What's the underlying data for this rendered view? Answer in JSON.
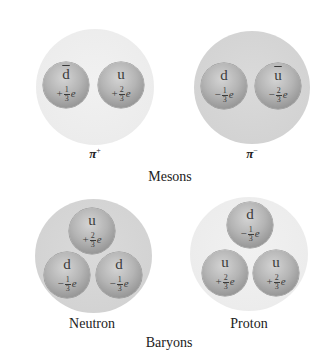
{
  "mesons": {
    "group_label": "Mesons",
    "particles": [
      {
        "name": "π",
        "superscript": "+",
        "quarks": [
          {
            "name": "d",
            "anti": true,
            "sign": "+",
            "num": "1",
            "den": "3",
            "unit": "e"
          },
          {
            "name": "u",
            "anti": false,
            "sign": "+",
            "num": "2",
            "den": "3",
            "unit": "e"
          }
        ]
      },
      {
        "name": "π",
        "superscript": "−",
        "quarks": [
          {
            "name": "d",
            "anti": false,
            "sign": "−",
            "num": "1",
            "den": "3",
            "unit": "e"
          },
          {
            "name": "u",
            "anti": true,
            "sign": "−",
            "num": "2",
            "den": "3",
            "unit": "e"
          }
        ]
      }
    ]
  },
  "baryons": {
    "group_label": "Baryons",
    "particles": [
      {
        "name": "Neutron",
        "quarks": [
          {
            "name": "u",
            "anti": false,
            "sign": "+",
            "num": "2",
            "den": "3",
            "unit": "e"
          },
          {
            "name": "d",
            "anti": false,
            "sign": "−",
            "num": "1",
            "den": "3",
            "unit": "e"
          },
          {
            "name": "d",
            "anti": false,
            "sign": "−",
            "num": "1",
            "den": "3",
            "unit": "e"
          }
        ]
      },
      {
        "name": "Proton",
        "quarks": [
          {
            "name": "d",
            "anti": false,
            "sign": "−",
            "num": "1",
            "den": "3",
            "unit": "e"
          },
          {
            "name": "u",
            "anti": false,
            "sign": "+",
            "num": "2",
            "den": "3",
            "unit": "e"
          },
          {
            "name": "u",
            "anti": false,
            "sign": "+",
            "num": "2",
            "den": "3",
            "unit": "e"
          }
        ]
      }
    ]
  },
  "colors": {
    "light_hadron": "#ececec",
    "dark_hadron": "#d3d3d3",
    "quark_sphere": "#a8a8a8",
    "text": "#333333"
  }
}
